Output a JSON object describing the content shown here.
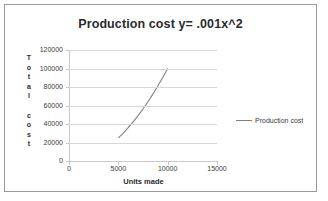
{
  "chart_data": {
    "type": "line",
    "title": "Production cost y= .001x^2",
    "xlabel": "Units made",
    "ylabel": "Total cost",
    "ylabel_chars": [
      "T",
      "o",
      "t",
      "a",
      "l",
      "",
      "c",
      "o",
      "s",
      "t"
    ],
    "xlim": [
      0,
      15000
    ],
    "ylim": [
      0,
      120000
    ],
    "xticks": [
      0,
      5000,
      10000,
      15000
    ],
    "xtick_labels": [
      "0",
      "5000",
      "10000",
      "15000"
    ],
    "yticks": [
      0,
      20000,
      40000,
      60000,
      80000,
      100000,
      120000
    ],
    "ytick_labels": [
      "0",
      "20000",
      "40000",
      "60000",
      "80000",
      "100000",
      "120000"
    ],
    "grid": "horizontal",
    "legend_position": "right",
    "series": [
      {
        "name": "Production cost",
        "color": "#808080",
        "x": [
          5000,
          5500,
          6000,
          6500,
          7000,
          7500,
          8000,
          8500,
          9000,
          9500,
          10000
        ],
        "values": [
          25000,
          30250,
          36000,
          42250,
          49000,
          56250,
          64000,
          72250,
          81000,
          90250,
          100000
        ]
      }
    ]
  },
  "legend": {
    "entries": [
      {
        "label": "Production cost",
        "color": "#808080"
      }
    ]
  },
  "colors": {
    "frame_border": "#9a9a9a",
    "gridline": "#d6d6d6",
    "axis_line": "#c9c9c9",
    "series_line": "#808080",
    "text": "#2b2b2b",
    "background": "#ffffff"
  }
}
